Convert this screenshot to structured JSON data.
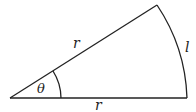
{
  "diagram": {
    "type": "circular-sector",
    "labels": {
      "upper_radius": "r",
      "lower_radius": "r",
      "arc_length": "l",
      "angle": "θ"
    },
    "colors": {
      "stroke": "#222222",
      "background": "#ffffff"
    }
  }
}
